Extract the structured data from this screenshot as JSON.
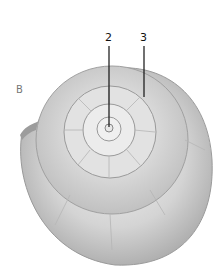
{
  "figure": {
    "panel_label": "B",
    "callouts": [
      {
        "id": "2",
        "label": "2",
        "target": "apex"
      },
      {
        "id": "3",
        "label": "3",
        "target": "suture"
      }
    ],
    "colors": {
      "shell_light": "#e6e6e6",
      "shell_mid": "#bdbdbd",
      "shell_dark": "#8a8a8a",
      "leader_line": "#111111"
    }
  }
}
